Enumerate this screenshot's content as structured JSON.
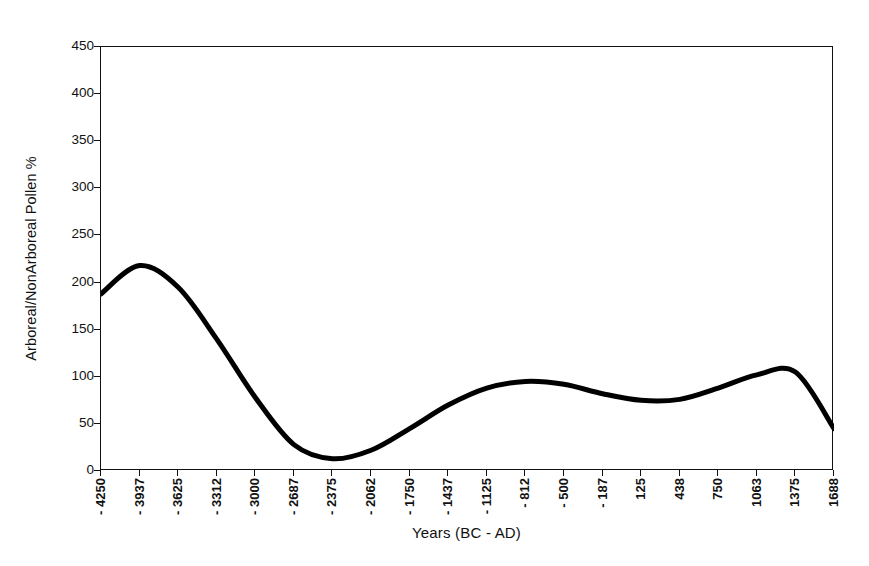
{
  "chart_data": {
    "type": "line",
    "title": "",
    "xlabel": "Years (BC - AD)",
    "ylabel": "Arboreal/NonArboreal Pollen %",
    "ylim": [
      0,
      450
    ],
    "ytick_step": 50,
    "yticks": [
      0,
      50,
      100,
      150,
      200,
      250,
      300,
      350,
      400,
      450
    ],
    "grid": false,
    "legend": "none",
    "line_color": "#000000",
    "line_width_px": 5,
    "categories": [
      "- 4250",
      "- 3937",
      "- 3625",
      "- 3312",
      "- 3000",
      "- 2687",
      "- 2375",
      "- 2062",
      "- 1750",
      "- 1437",
      "- 1125",
      "- 812",
      "- 500",
      "- 187",
      "125",
      "438",
      "750",
      "1063",
      "1375",
      "1688"
    ],
    "x": [
      -4250,
      -3937,
      -3625,
      -3312,
      -3000,
      -2687,
      -2375,
      -2062,
      -1750,
      -1437,
      -1125,
      -812,
      -500,
      -187,
      125,
      438,
      750,
      1063,
      1375,
      1688
    ],
    "values": [
      188,
      218,
      195,
      140,
      78,
      28,
      13,
      22,
      45,
      70,
      88,
      95,
      92,
      82,
      75,
      76,
      88,
      102,
      105,
      45
    ],
    "series": [
      {
        "name": "Arboreal/NonArboreal Pollen %",
        "values": [
          188,
          218,
          195,
          140,
          78,
          28,
          13,
          22,
          45,
          70,
          88,
          95,
          92,
          82,
          75,
          76,
          88,
          102,
          105,
          45
        ]
      }
    ],
    "annotations": []
  },
  "axes": {
    "x_title": "Years (BC - AD)",
    "y_title": "Arboreal/NonArboreal Pollen %",
    "y_labels": [
      "450",
      "400",
      "350",
      "300",
      "250",
      "200",
      "150",
      "100",
      "50",
      "0"
    ],
    "x_labels": [
      "- 4250",
      "- 3937",
      "- 3625",
      "- 3312",
      "- 3000",
      "- 2687",
      "- 2375",
      "- 2062",
      "- 1750",
      "- 1437",
      "- 1125",
      "- 812",
      "- 500",
      "- 187",
      "125",
      "438",
      "750",
      "1063",
      "1375",
      "1688"
    ]
  },
  "colors": {
    "background": "#ffffff",
    "foreground": "#111111",
    "line": "#000000"
  }
}
